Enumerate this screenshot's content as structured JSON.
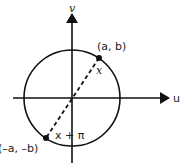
{
  "diagram": {
    "title": "",
    "axes": {
      "horizontal_label": "u",
      "vertical_label": "v"
    },
    "points": [
      {
        "label": "(a,  b)",
        "angle_label": "x"
      },
      {
        "label": "(–a,  –b)",
        "angle_label": "x + π"
      }
    ],
    "colors": {
      "stroke": "#111111",
      "background": "#ffffff"
    }
  }
}
